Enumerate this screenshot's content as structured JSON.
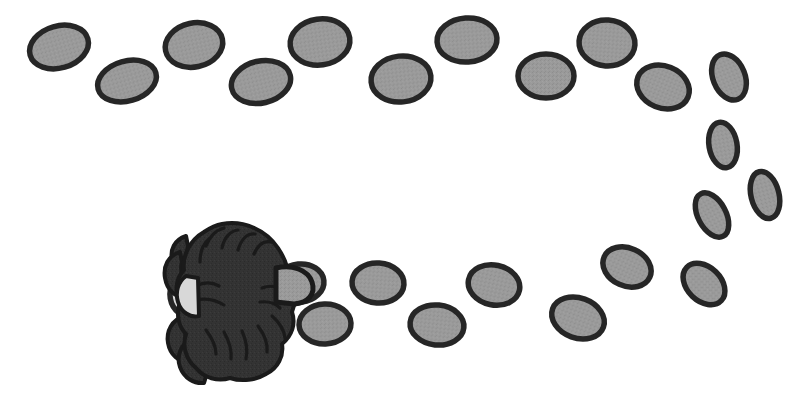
{
  "scene": {
    "title": "Spider footprint trail",
    "description": "A looping trail of oval footprints leading to a dark spider figure",
    "width": 806,
    "height": 411,
    "background_color": "#ffffff"
  },
  "style": {
    "print_fill": "#959595",
    "print_stroke": "#262626",
    "print_stroke_width": 5.5,
    "creature_fill": "#333333",
    "creature_stroke": "#1a1a1a",
    "creature_stroke_width": 4,
    "hidden_print_fill": "#d8d8d8"
  },
  "creature": {
    "name": "spider",
    "center_x": 232,
    "center_y": 300,
    "label": "spider"
  },
  "footprints": [
    {
      "id": "print-01",
      "cx": 59,
      "cy": 47,
      "rx": 30,
      "ry": 21,
      "rot": -16
    },
    {
      "id": "print-02",
      "cx": 127,
      "cy": 81,
      "rx": 30,
      "ry": 20,
      "rot": -16
    },
    {
      "id": "print-03",
      "cx": 194,
      "cy": 45,
      "rx": 29,
      "ry": 22,
      "rot": -12
    },
    {
      "id": "print-04",
      "cx": 261,
      "cy": 82,
      "rx": 30,
      "ry": 21,
      "rot": -13
    },
    {
      "id": "print-05",
      "cx": 320,
      "cy": 42,
      "rx": 30,
      "ry": 23,
      "rot": -8
    },
    {
      "id": "print-06",
      "cx": 401,
      "cy": 79,
      "rx": 30,
      "ry": 23,
      "rot": -6
    },
    {
      "id": "print-07",
      "cx": 467,
      "cy": 40,
      "rx": 30,
      "ry": 22,
      "rot": -4
    },
    {
      "id": "print-08",
      "cx": 546,
      "cy": 76,
      "rx": 28,
      "ry": 22,
      "rot": 0
    },
    {
      "id": "print-09",
      "cx": 607,
      "cy": 43,
      "rx": 28,
      "ry": 23,
      "rot": 4
    },
    {
      "id": "print-10",
      "cx": 663,
      "cy": 87,
      "rx": 27,
      "ry": 21,
      "rot": 22
    },
    {
      "id": "print-11",
      "cx": 729,
      "cy": 77,
      "rx": 24,
      "ry": 16,
      "rot": 68
    },
    {
      "id": "print-12",
      "cx": 723,
      "cy": 145,
      "rx": 23,
      "ry": 14,
      "rot": 80
    },
    {
      "id": "print-13",
      "cx": 765,
      "cy": 195,
      "rx": 24,
      "ry": 14,
      "rot": 76
    },
    {
      "id": "print-14",
      "cx": 712,
      "cy": 215,
      "rx": 24,
      "ry": 14,
      "rot": 62
    },
    {
      "id": "print-15",
      "cx": 704,
      "cy": 284,
      "rx": 24,
      "ry": 17,
      "rot": 44
    },
    {
      "id": "print-16",
      "cx": 627,
      "cy": 267,
      "rx": 25,
      "ry": 19,
      "rot": 24
    },
    {
      "id": "print-17",
      "cx": 578,
      "cy": 318,
      "rx": 27,
      "ry": 20,
      "rot": 20
    },
    {
      "id": "print-18",
      "cx": 494,
      "cy": 285,
      "rx": 26,
      "ry": 20,
      "rot": 12
    },
    {
      "id": "print-19",
      "cx": 437,
      "cy": 325,
      "rx": 27,
      "ry": 20,
      "rot": 6
    },
    {
      "id": "print-20",
      "cx": 378,
      "cy": 283,
      "rx": 26,
      "ry": 20,
      "rot": 4
    },
    {
      "id": "print-21",
      "cx": 325,
      "cy": 324,
      "rx": 26,
      "ry": 20,
      "rot": -2
    },
    {
      "id": "print-22",
      "cx": 300,
      "cy": 283,
      "rx": 24,
      "ry": 19,
      "rot": -6
    }
  ],
  "occluded_footprints": [
    {
      "id": "print-hidden-left",
      "cx": 190,
      "cy": 295,
      "rx": 20,
      "ry": 22,
      "rot": -10
    }
  ],
  "legend": {
    "footprint_label": "footprint",
    "creature_label": "spider"
  }
}
